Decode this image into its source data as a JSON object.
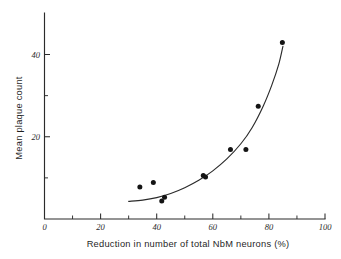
{
  "chart_data": {
    "type": "scatter",
    "title": "",
    "xlabel": "Reduction in number of total NbM neurons (%)",
    "ylabel": "Mean plaque count",
    "xlim": [
      0,
      100
    ],
    "ylim": [
      0,
      50
    ],
    "grid": false,
    "legend": "none",
    "x_ticks": [
      {
        "value": 0,
        "label": "0",
        "major": true
      },
      {
        "value": 10,
        "label": "",
        "major": false
      },
      {
        "value": 20,
        "label": "20",
        "major": true
      },
      {
        "value": 30,
        "label": "",
        "major": false
      },
      {
        "value": 40,
        "label": "40",
        "major": true
      },
      {
        "value": 50,
        "label": "",
        "major": false
      },
      {
        "value": 60,
        "label": "60",
        "major": true
      },
      {
        "value": 70,
        "label": "",
        "major": false
      },
      {
        "value": 80,
        "label": "80",
        "major": true
      },
      {
        "value": 90,
        "label": "",
        "major": false
      },
      {
        "value": 100,
        "label": "100",
        "major": true
      }
    ],
    "y_ticks": [
      {
        "value": 10,
        "label": "",
        "major": false
      },
      {
        "value": 20,
        "label": "20",
        "major": true
      },
      {
        "value": 30,
        "label": "",
        "major": false
      },
      {
        "value": 40,
        "label": "40",
        "major": true
      }
    ],
    "series": [
      {
        "name": "cases",
        "marker": "filled-circle",
        "color": "#141414",
        "points": [
          {
            "x": 34.0,
            "y": 7.8
          },
          {
            "x": 38.8,
            "y": 8.9
          },
          {
            "x": 41.8,
            "y": 4.4
          },
          {
            "x": 42.8,
            "y": 5.3
          },
          {
            "x": 56.6,
            "y": 10.6
          },
          {
            "x": 57.4,
            "y": 10.2
          },
          {
            "x": 66.3,
            "y": 16.9
          },
          {
            "x": 71.8,
            "y": 16.9
          },
          {
            "x": 76.2,
            "y": 27.4
          },
          {
            "x": 84.8,
            "y": 42.9
          }
        ]
      }
    ],
    "fit_curve": {
      "name": "exponential-trend",
      "color": "#2b2b2b",
      "points": [
        {
          "x": 30.0,
          "y": 4.3
        },
        {
          "x": 35.0,
          "y": 4.6
        },
        {
          "x": 40.0,
          "y": 5.2
        },
        {
          "x": 45.0,
          "y": 6.2
        },
        {
          "x": 50.0,
          "y": 7.6
        },
        {
          "x": 55.0,
          "y": 9.4
        },
        {
          "x": 60.0,
          "y": 11.7
        },
        {
          "x": 65.0,
          "y": 14.6
        },
        {
          "x": 70.0,
          "y": 18.3
        },
        {
          "x": 74.0,
          "y": 22.2
        },
        {
          "x": 78.0,
          "y": 27.5
        },
        {
          "x": 81.0,
          "y": 32.5
        },
        {
          "x": 83.5,
          "y": 37.6
        },
        {
          "x": 85.0,
          "y": 42.0
        }
      ]
    }
  }
}
